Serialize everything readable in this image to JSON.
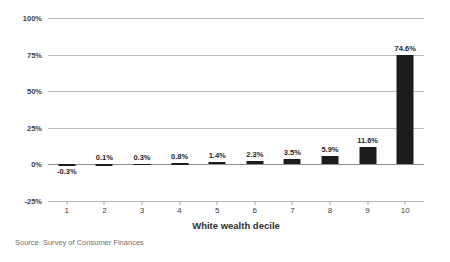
{
  "chart_data": {
    "type": "bar",
    "title": "",
    "subtitle": "",
    "xlabel": "White wealth decile",
    "ylabel": "",
    "categories": [
      "1",
      "2",
      "3",
      "4",
      "5",
      "6",
      "7",
      "8",
      "9",
      "10"
    ],
    "values": [
      -0.3,
      0.1,
      0.3,
      0.8,
      1.4,
      2.3,
      3.5,
      5.9,
      11.6,
      74.6
    ],
    "data_labels": [
      "-0.3%",
      "0.1%",
      "0.3%",
      "0.8%",
      "1.4%",
      "2.3%",
      "3.5%",
      "5.9%",
      "11.6%",
      "74.6%"
    ],
    "ylim": [
      -25,
      100
    ],
    "yticks": [
      100,
      75,
      50,
      25,
      0,
      -25
    ],
    "ytick_labels": [
      "100%",
      "75%",
      "50%",
      "25%",
      "0%",
      "-25%"
    ],
    "grid": true,
    "legend": "none",
    "bar_color": "#1c1c1c",
    "gridline_color": "#b9b9b9",
    "zero_line_color": "#8d8d8d",
    "source": "Source: Survey of Consumer Finances"
  }
}
